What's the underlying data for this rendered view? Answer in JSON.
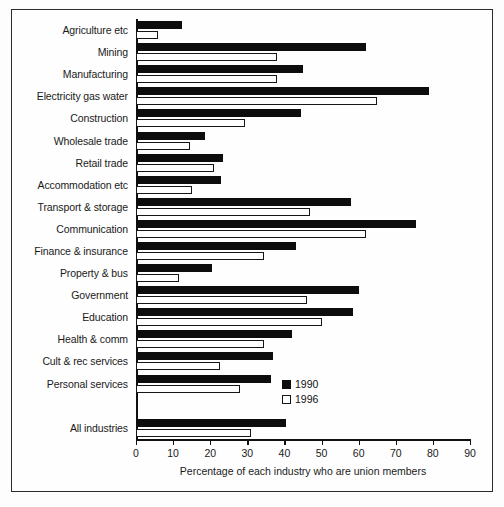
{
  "chart_data": {
    "type": "bar",
    "orientation": "horizontal",
    "title": "",
    "xlabel": "Percentage of each industry who are union members",
    "ylabel": "",
    "xlim": [
      0,
      90
    ],
    "xticks": [
      0,
      10,
      20,
      30,
      40,
      50,
      60,
      70,
      80,
      90
    ],
    "grid": false,
    "legend_position": "inside-bottom-right",
    "categories": [
      "Agriculture etc",
      "Mining",
      "Manufacturing",
      "Electricity gas water",
      "Construction",
      "Wholesale trade",
      "Retail trade",
      "Accommodation etc",
      "Transport & storage",
      "Communication",
      "Finance & insurance",
      "Property & bus",
      "Government",
      "Education",
      "Health & comm",
      "Cult & rec services",
      "Personal services",
      "",
      "All industries"
    ],
    "series": [
      {
        "name": "1990",
        "color": "#0d0d0d",
        "values": [
          12.5,
          62,
          45,
          79,
          44.5,
          18.5,
          23.5,
          23,
          58,
          75.5,
          43,
          20.5,
          60,
          58.5,
          42,
          37,
          36.5,
          null,
          40.5
        ]
      },
      {
        "name": "1996",
        "color": "#ffffff",
        "values": [
          6,
          38,
          38,
          65,
          29.5,
          14.5,
          21,
          15,
          47,
          62,
          34.5,
          11.5,
          46,
          50,
          34.5,
          22.5,
          28,
          null,
          31
        ]
      }
    ]
  },
  "legend": {
    "items": [
      {
        "label": "1990",
        "swatch": "filled-black-square"
      },
      {
        "label": "1996",
        "swatch": "outlined-white-square"
      }
    ]
  }
}
